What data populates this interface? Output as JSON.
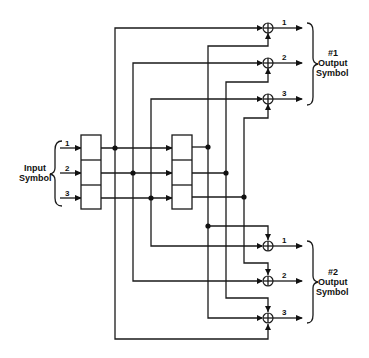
{
  "diagram": {
    "type": "convolutional-encoder",
    "input": {
      "label_line1": "Input",
      "label_line2": "Symbol",
      "bits": [
        "1",
        "2",
        "3"
      ]
    },
    "output1": {
      "label_line1": "#1",
      "label_line2": "Output",
      "label_line3": "Symbol",
      "bits": [
        "1",
        "2",
        "3"
      ]
    },
    "output2": {
      "label_line1": "#2",
      "label_line2": "Output",
      "label_line3": "Symbol",
      "bits": [
        "1",
        "2",
        "3"
      ]
    },
    "registers": [
      {
        "name": "register-1",
        "cells": 3
      },
      {
        "name": "register-2",
        "cells": 3
      }
    ],
    "adders": 6,
    "colors": {
      "line": "#1a1a1a",
      "background": "#ffffff"
    }
  }
}
